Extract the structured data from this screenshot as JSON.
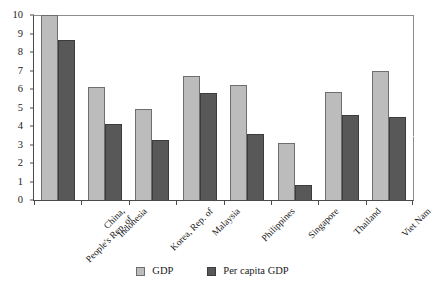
{
  "chart_data": {
    "type": "bar",
    "title": "",
    "subtitle": "",
    "xlabel": "",
    "ylabel": "",
    "ylim": [
      0,
      10
    ],
    "y_ticks": [
      0,
      1,
      2,
      3,
      4,
      5,
      6,
      7,
      8,
      9,
      10
    ],
    "y_tick_labels": [
      "0",
      "1",
      "2",
      "3",
      "4",
      "5",
      "6",
      "7",
      "8",
      "9",
      "10"
    ],
    "grid": false,
    "legend_position": "bottom-center",
    "categories": [
      "China, People's Rep. of",
      "Indonesia",
      "Korea, Rep. of",
      "Malaysia",
      "Philippines",
      "Singapore",
      "Thailand",
      "Viet Nam"
    ],
    "category_lines": [
      [
        "China,",
        "People's Rep. of"
      ],
      [
        "Indonesia"
      ],
      [
        "Korea, Rep. of"
      ],
      [
        "Malaysia"
      ],
      [
        "Philippines"
      ],
      [
        "Singapore"
      ],
      [
        "Thailand"
      ],
      [
        "Viet Nam"
      ]
    ],
    "series": [
      {
        "name": "GDP",
        "color": "#bcbcbc",
        "values": [
          10.0,
          6.1,
          4.9,
          6.7,
          6.2,
          3.1,
          5.85,
          7.0
        ]
      },
      {
        "name": "Per capita GDP",
        "color": "#585858",
        "values": [
          8.65,
          4.1,
          3.25,
          5.8,
          3.55,
          0.8,
          4.6,
          4.5
        ]
      }
    ]
  },
  "legend": {
    "items": [
      {
        "label": "GDP",
        "swatch": "gdp"
      },
      {
        "label": "Per capita GDP",
        "swatch": "percap"
      }
    ]
  }
}
